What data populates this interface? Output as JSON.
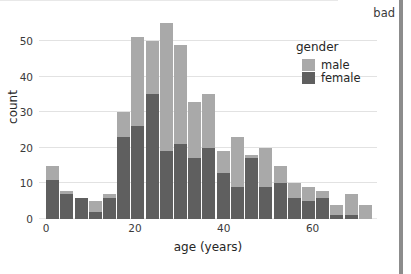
{
  "annotation": {
    "label": "bad",
    "marker_color": "#8c8c8c"
  },
  "legend": {
    "title": "gender",
    "position": "top-right-inside",
    "entries": [
      {
        "label": "male",
        "color": "#a9a9a9"
      },
      {
        "label": "female",
        "color": "#5f5f5f"
      }
    ]
  },
  "chart_data": {
    "type": "bar",
    "subtype": "stacked-histogram",
    "title": "",
    "xlabel": "age (years)",
    "ylabel": "count",
    "xlim": [
      -1.6,
      74.5
    ],
    "ylim": [
      0,
      57
    ],
    "xticks": [
      0,
      20,
      40,
      60
    ],
    "xticklabels": [
      "0",
      "20",
      "40",
      "60"
    ],
    "yticks": [
      0,
      10,
      20,
      30,
      40,
      50
    ],
    "yticklabels": [
      "0",
      "10",
      "20",
      "30",
      "40",
      "50"
    ],
    "grid": "horizontal",
    "bin_width": 3.2,
    "bin_starts": [
      0.0,
      3.2,
      6.4,
      9.6,
      12.8,
      16.0,
      19.2,
      22.4,
      25.6,
      28.8,
      32.0,
      35.2,
      38.4,
      41.6,
      44.8,
      48.0,
      51.2,
      54.4,
      57.6,
      60.8,
      64.0,
      67.2,
      70.4
    ],
    "bin_centers": [
      1.6,
      4.8,
      8.0,
      11.2,
      14.4,
      17.6,
      20.8,
      24.0,
      27.2,
      30.4,
      33.6,
      36.8,
      40.0,
      43.2,
      46.4,
      49.6,
      52.8,
      56.0,
      59.2,
      62.4,
      65.6,
      68.8,
      72.0
    ],
    "categories": [
      "0-3",
      "3-6",
      "6-10",
      "10-13",
      "13-16",
      "16-19",
      "19-22",
      "22-26",
      "26-29",
      "29-32",
      "32-35",
      "35-38",
      "38-42",
      "42-45",
      "45-48",
      "48-51",
      "51-54",
      "54-58",
      "58-61",
      "61-64",
      "64-67",
      "67-70",
      "70-74"
    ],
    "series": [
      {
        "name": "female",
        "color": "#5f5f5f",
        "values": [
          11,
          7,
          6,
          2,
          6,
          23,
          26,
          35,
          19,
          21,
          17,
          20,
          13,
          9,
          17,
          9,
          10,
          6,
          5,
          6,
          1,
          1,
          0
        ]
      },
      {
        "name": "male",
        "color": "#a9a9a9",
        "values": [
          4,
          1,
          0,
          3,
          1,
          7,
          25,
          15,
          36,
          28,
          16,
          15,
          6,
          14,
          1,
          11,
          5,
          4,
          4,
          2,
          3,
          6,
          4
        ]
      }
    ],
    "totals": [
      15,
      8,
      6,
      5,
      7,
      30,
      51,
      50,
      55,
      49,
      33,
      35,
      19,
      23,
      18,
      20,
      15,
      10,
      9,
      8,
      4,
      7,
      4
    ]
  }
}
